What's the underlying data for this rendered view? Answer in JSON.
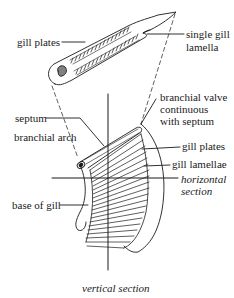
{
  "diagram": {
    "type": "anatomical-illustration",
    "colors": {
      "ink": "#1a1a1a",
      "background": "#ffffff"
    },
    "top_detail": {
      "labels": {
        "gill_plates": "gill plates",
        "single_gill_lamella_line1": "single gill",
        "single_gill_lamella_line2": "lamella"
      }
    },
    "main_view": {
      "labels": {
        "branchial_valve_line1": "branchial valve",
        "branchial_valve_line2": "continuous",
        "branchial_valve_line3": "with septum",
        "septum": "septum",
        "branchial_arch": "branchial arch",
        "gill_plates": "gill plates",
        "gill_lamellae": "gill lamellae",
        "horizontal_section_line1": "horizontal",
        "horizontal_section_line2": "section",
        "base_of_gill": "base of gill",
        "vertical_section": "vertical section"
      }
    }
  }
}
